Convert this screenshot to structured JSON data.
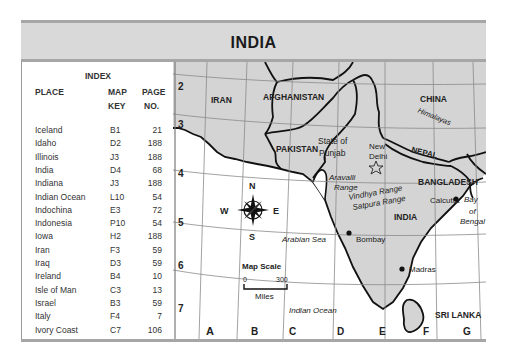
{
  "title": "INDIA",
  "index": {
    "title": "INDEX",
    "headers": {
      "place": "PLACE",
      "map_key_1": "MAP",
      "map_key_2": "KEY",
      "page_1": "PAGE",
      "page_2": "NO."
    },
    "rows": [
      {
        "place": "Iceland",
        "key": "B1",
        "page": "21"
      },
      {
        "place": "Idaho",
        "key": "D2",
        "page": "188"
      },
      {
        "place": "Illinois",
        "key": "J3",
        "page": "188"
      },
      {
        "place": "India",
        "key": "D4",
        "page": "68"
      },
      {
        "place": "Indiana",
        "key": "J3",
        "page": "188"
      },
      {
        "place": "Indian Ocean",
        "key": "L10",
        "page": "54"
      },
      {
        "place": "Indochina",
        "key": "E3",
        "page": "72"
      },
      {
        "place": "Indonesia",
        "key": "P10",
        "page": "54"
      },
      {
        "place": "Iowa",
        "key": "H2",
        "page": "188"
      },
      {
        "place": "Iran",
        "key": "F3",
        "page": "59"
      },
      {
        "place": "Iraq",
        "key": "D3",
        "page": "59"
      },
      {
        "place": "Ireland",
        "key": "B4",
        "page": "10"
      },
      {
        "place": "Isle of Man",
        "key": "C3",
        "page": "13"
      },
      {
        "place": "Israel",
        "key": "B3",
        "page": "59"
      },
      {
        "place": "Italy",
        "key": "F4",
        "page": "7"
      },
      {
        "place": "Ivory Coast",
        "key": "C7",
        "page": "106"
      }
    ]
  },
  "map": {
    "row_labels": [
      "2",
      "3",
      "4",
      "5",
      "6",
      "7"
    ],
    "col_labels": [
      "A",
      "B",
      "C",
      "D",
      "E",
      "F",
      "G"
    ],
    "countries": {
      "iran": "IRAN",
      "afghanistan": "AFGHANISTAN",
      "pakistan": "PAKISTAN",
      "china": "CHINA",
      "nepal": "NEPAL",
      "bangladesh": "BANGLADESH",
      "india": "INDIA",
      "sri_lanka": "SRI LANKA"
    },
    "regions": {
      "punjab_1": "State of",
      "punjab_2": "Punjab"
    },
    "features": {
      "himalayas": "Himalayas",
      "aravalli_1": "Aravalli",
      "aravalli_2": "Range",
      "vindhya": "Vindhya Range",
      "satpura": "Satpura Range",
      "arabian_sea": "Arabian Sea",
      "bay_1": "Bay",
      "bay_2": "of",
      "bay_3": "Bengal",
      "indian_ocean": "Indian Ocean"
    },
    "cities": {
      "capital_1": "New",
      "capital_2": "Delhi",
      "calcutta": "Calcutta",
      "bombay": "Bombay",
      "madras": "Madras"
    },
    "compass": {
      "n": "N",
      "s": "S",
      "e": "E",
      "w": "W"
    },
    "scale": {
      "title": "Map Scale",
      "min": "0",
      "max": "300",
      "unit": "Miles"
    },
    "colors": {
      "land": "#d4d4d4",
      "water": "#ffffff",
      "border": "#111111",
      "grid": "#8a8a8a",
      "title_bar": "#d9d9d9"
    }
  }
}
